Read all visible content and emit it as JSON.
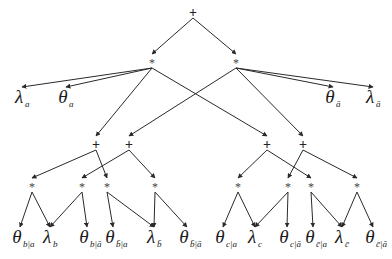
{
  "diagram": {
    "type": "arithmetic-circuit",
    "nodes": [
      {
        "id": "root",
        "op": "+",
        "x": 193,
        "y": 13
      },
      {
        "id": "m1",
        "op": "*",
        "x": 152,
        "y": 63
      },
      {
        "id": "m2",
        "op": "*",
        "x": 236,
        "y": 63
      },
      {
        "id": "s1",
        "op": "+",
        "x": 96,
        "y": 145
      },
      {
        "id": "s2",
        "op": "+",
        "x": 129,
        "y": 145
      },
      {
        "id": "s3",
        "op": "+",
        "x": 267,
        "y": 145
      },
      {
        "id": "s4",
        "op": "+",
        "x": 303,
        "y": 145
      },
      {
        "id": "p1",
        "op": "*",
        "x": 32,
        "y": 187
      },
      {
        "id": "p2",
        "op": "*",
        "x": 82,
        "y": 187
      },
      {
        "id": "p3",
        "op": "*",
        "x": 107,
        "y": 187
      },
      {
        "id": "p4",
        "op": "*",
        "x": 155,
        "y": 187
      },
      {
        "id": "p5",
        "op": "*",
        "x": 238,
        "y": 187
      },
      {
        "id": "p6",
        "op": "*",
        "x": 288,
        "y": 187
      },
      {
        "id": "p7",
        "op": "*",
        "x": 311,
        "y": 187
      },
      {
        "id": "p8",
        "op": "*",
        "x": 357,
        "y": 187
      }
    ],
    "leaves": [
      {
        "id": "lambda_a",
        "symbol": "λ",
        "subscript": "a",
        "x": 22,
        "y": 103
      },
      {
        "id": "theta_a",
        "symbol": "θ",
        "subscript": "a",
        "x": 66,
        "y": 103
      },
      {
        "id": "theta_abar",
        "symbol": "θ",
        "subscript": "ā",
        "x": 333,
        "y": 103
      },
      {
        "id": "lambda_abar",
        "symbol": "λ",
        "subscript": "ā",
        "x": 373,
        "y": 103
      },
      {
        "id": "theta_b_a",
        "symbol": "θ",
        "subscript": "b|a",
        "x": 20,
        "y": 243
      },
      {
        "id": "lambda_b",
        "symbol": "λ",
        "subscript": "b",
        "x": 50,
        "y": 243
      },
      {
        "id": "theta_b_abar",
        "symbol": "θ",
        "subscript": "b|ā",
        "x": 87,
        "y": 243
      },
      {
        "id": "theta_bbar_a",
        "symbol": "θ",
        "subscript": "b̄|a",
        "x": 113,
        "y": 243
      },
      {
        "id": "lambda_bbar",
        "symbol": "λ",
        "subscript": "b̄",
        "x": 154,
        "y": 243
      },
      {
        "id": "theta_bbar_abar",
        "symbol": "θ",
        "subscript": "b̄|ā",
        "x": 187,
        "y": 243
      },
      {
        "id": "theta_c_a",
        "symbol": "θ",
        "subscript": "c|a",
        "x": 223,
        "y": 243
      },
      {
        "id": "lambda_c",
        "symbol": "λ",
        "subscript": "c",
        "x": 255,
        "y": 243
      },
      {
        "id": "theta_c_abar",
        "symbol": "θ",
        "subscript": "c|ā",
        "x": 287,
        "y": 243
      },
      {
        "id": "theta_cbar_a",
        "symbol": "θ",
        "subscript": "c̄|a",
        "x": 313,
        "y": 243
      },
      {
        "id": "lambda_cbar",
        "symbol": "λ",
        "subscript": "c̄",
        "x": 342,
        "y": 243
      },
      {
        "id": "theta_cbar_abar",
        "symbol": "θ",
        "subscript": "c̄|ā",
        "x": 373,
        "y": 243
      }
    ],
    "edges": [
      [
        "root",
        "m1"
      ],
      [
        "root",
        "m2"
      ],
      [
        "m1",
        "lambda_a"
      ],
      [
        "m1",
        "theta_a"
      ],
      [
        "m1",
        "s1"
      ],
      [
        "m1",
        "s3"
      ],
      [
        "m2",
        "theta_abar"
      ],
      [
        "m2",
        "lambda_abar"
      ],
      [
        "m2",
        "s2"
      ],
      [
        "m2",
        "s4"
      ],
      [
        "s1",
        "p1"
      ],
      [
        "s1",
        "p3"
      ],
      [
        "s2",
        "p2"
      ],
      [
        "s2",
        "p4"
      ],
      [
        "s3",
        "p5"
      ],
      [
        "s3",
        "p7"
      ],
      [
        "s4",
        "p6"
      ],
      [
        "s4",
        "p8"
      ],
      [
        "p1",
        "theta_b_a"
      ],
      [
        "p1",
        "lambda_b"
      ],
      [
        "p2",
        "lambda_b"
      ],
      [
        "p2",
        "theta_b_abar"
      ],
      [
        "p3",
        "theta_bbar_a"
      ],
      [
        "p3",
        "lambda_bbar"
      ],
      [
        "p4",
        "lambda_bbar"
      ],
      [
        "p4",
        "theta_bbar_abar"
      ],
      [
        "p5",
        "theta_c_a"
      ],
      [
        "p5",
        "lambda_c"
      ],
      [
        "p6",
        "lambda_c"
      ],
      [
        "p6",
        "theta_c_abar"
      ],
      [
        "p7",
        "theta_cbar_a"
      ],
      [
        "p7",
        "lambda_cbar"
      ],
      [
        "p8",
        "lambda_cbar"
      ],
      [
        "p8",
        "theta_cbar_abar"
      ]
    ],
    "colors": {
      "line": "#2a2a2a",
      "text": "#1a1a1a",
      "background": "#ffffff"
    }
  }
}
